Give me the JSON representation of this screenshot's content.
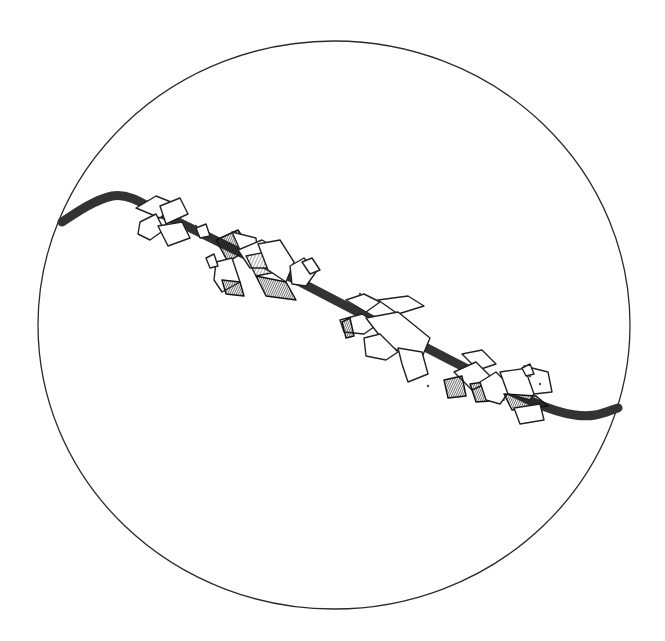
{
  "figure": {
    "kind": "microscope-field-line-drawing",
    "field_of_view": {
      "cx": 334,
      "cy": 325,
      "rx": 296,
      "ry": 284,
      "stroke": "#2a2a2a"
    },
    "rod": {
      "path": "M62,222 C80,210 95,200 112,196 C130,193 145,205 160,213 L300,282 L450,360 C500,385 540,410 575,415 C595,418 605,412 618,408",
      "widths": [
        9,
        4.5,
        1
      ],
      "colors": [
        "#222",
        "#ffffff",
        "#333"
      ]
    },
    "crystals": [
      {
        "type": "face",
        "pts": "136,208 156,196 176,204 160,218"
      },
      {
        "type": "face",
        "pts": "160,206 180,198 188,214 166,224"
      },
      {
        "type": "face",
        "pts": "140,222 156,214 164,230 150,240 138,234"
      },
      {
        "type": "face",
        "pts": "158,226 182,222 190,238 168,246"
      },
      {
        "type": "face",
        "pts": "196,228 206,224 210,236 200,238"
      },
      {
        "type": "dark",
        "pts": "216,240 238,230 250,248 228,262"
      },
      {
        "type": "face",
        "pts": "232,232 256,238 258,256 240,250"
      },
      {
        "type": "face",
        "pts": "216,262 232,258 240,282 222,292 214,280"
      },
      {
        "type": "dark",
        "pts": "222,280 240,282 244,296 226,294"
      },
      {
        "type": "face",
        "pts": "238,250 262,240 282,252 270,268 250,268"
      },
      {
        "type": "shade",
        "pts": "246,256 266,252 276,272 256,276"
      },
      {
        "type": "face",
        "pts": "258,244 280,240 294,262 286,282 268,270"
      },
      {
        "type": "dark",
        "pts": "256,276 286,282 296,300 266,296"
      },
      {
        "type": "face",
        "pts": "290,266 304,258 316,272 306,286 292,284"
      },
      {
        "type": "face",
        "pts": "302,262 312,258 320,270 310,274"
      },
      {
        "type": "face",
        "pts": "206,258 214,254 218,266 210,268"
      },
      {
        "type": "face",
        "pts": "346,300 364,294 380,302 366,312"
      },
      {
        "type": "face",
        "pts": "378,300 408,296 424,306 398,314"
      },
      {
        "type": "face",
        "pts": "340,320 362,314 378,324 364,334 344,332"
      },
      {
        "type": "dark",
        "pts": "342,322 350,318 354,336 346,338"
      },
      {
        "type": "face",
        "pts": "366,318 398,312 430,338 420,362 386,344"
      },
      {
        "type": "face",
        "pts": "364,338 380,334 398,352 386,360 366,356"
      },
      {
        "type": "face",
        "pts": "398,348 422,352 428,374 408,382 402,364"
      },
      {
        "type": "face",
        "pts": "462,354 482,350 496,364 478,370"
      },
      {
        "type": "face",
        "pts": "454,372 476,362 494,380 472,390"
      },
      {
        "type": "dark",
        "pts": "444,380 462,376 466,396 448,398"
      },
      {
        "type": "dark",
        "pts": "470,384 498,380 504,400 476,402"
      },
      {
        "type": "face",
        "pts": "480,382 496,372 512,388 500,404 486,400"
      },
      {
        "type": "face",
        "pts": "500,372 528,368 540,384 530,400 508,394"
      },
      {
        "type": "dark",
        "pts": "504,394 536,396 548,406 512,410"
      },
      {
        "type": "face",
        "pts": "514,408 540,404 544,420 520,424"
      },
      {
        "type": "face",
        "pts": "524,366 548,372 552,392 534,394"
      },
      {
        "type": "face",
        "pts": "522,368 530,364 534,374 526,376"
      }
    ],
    "specks": [
      {
        "x": 196,
        "y": 226
      },
      {
        "x": 360,
        "y": 294
      },
      {
        "x": 530,
        "y": 376
      },
      {
        "x": 540,
        "y": 384
      },
      {
        "x": 428,
        "y": 386
      }
    ]
  }
}
